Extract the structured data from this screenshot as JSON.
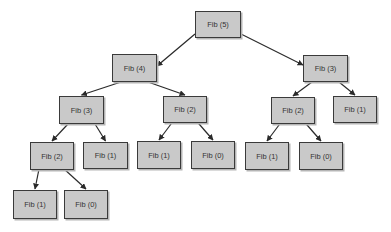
{
  "diagram": {
    "nodes": [
      {
        "id": "n0",
        "label": "Fib (5)",
        "x": 195,
        "y": 11,
        "w": 46,
        "h": 27
      },
      {
        "id": "n1",
        "label": "Fib (4)",
        "x": 112,
        "y": 54,
        "w": 45,
        "h": 28
      },
      {
        "id": "n2",
        "label": "Fib (3)",
        "x": 303,
        "y": 55,
        "w": 45,
        "h": 27
      },
      {
        "id": "n3",
        "label": "Fib (3)",
        "x": 59,
        "y": 96,
        "w": 45,
        "h": 28
      },
      {
        "id": "n4",
        "label": "Fib (2)",
        "x": 163,
        "y": 96,
        "w": 44,
        "h": 27
      },
      {
        "id": "n5",
        "label": "Fib (2)",
        "x": 271,
        "y": 97,
        "w": 44,
        "h": 27
      },
      {
        "id": "n6",
        "label": "Fib (1)",
        "x": 333,
        "y": 96,
        "w": 44,
        "h": 27
      },
      {
        "id": "n7",
        "label": "Fib (2)",
        "x": 30,
        "y": 142,
        "w": 44,
        "h": 28
      },
      {
        "id": "n8",
        "label": "Fib (1)",
        "x": 83,
        "y": 142,
        "w": 45,
        "h": 27
      },
      {
        "id": "n9",
        "label": "Fib (1)",
        "x": 137,
        "y": 141,
        "w": 44,
        "h": 28
      },
      {
        "id": "n10",
        "label": "Fib (0)",
        "x": 191,
        "y": 141,
        "w": 44,
        "h": 28
      },
      {
        "id": "n11",
        "label": "Fib (1)",
        "x": 245,
        "y": 142,
        "w": 44,
        "h": 28
      },
      {
        "id": "n12",
        "label": "Fib (0)",
        "x": 299,
        "y": 142,
        "w": 44,
        "h": 28
      },
      {
        "id": "n13",
        "label": "Fib (1)",
        "x": 13,
        "y": 190,
        "w": 44,
        "h": 29
      },
      {
        "id": "n14",
        "label": "Fib (0)",
        "x": 64,
        "y": 190,
        "w": 44,
        "h": 29
      }
    ],
    "edges": [
      [
        "n0",
        "n1"
      ],
      [
        "n0",
        "n2"
      ],
      [
        "n1",
        "n3"
      ],
      [
        "n1",
        "n4"
      ],
      [
        "n2",
        "n5"
      ],
      [
        "n2",
        "n6"
      ],
      [
        "n3",
        "n7"
      ],
      [
        "n3",
        "n8"
      ],
      [
        "n4",
        "n9"
      ],
      [
        "n4",
        "n10"
      ],
      [
        "n5",
        "n11"
      ],
      [
        "n5",
        "n12"
      ],
      [
        "n7",
        "n13"
      ],
      [
        "n7",
        "n14"
      ]
    ],
    "colors": {
      "node_fill": "#c9c9c9",
      "node_border": "#3a3a3a",
      "edge": "#2a2a2a"
    }
  }
}
